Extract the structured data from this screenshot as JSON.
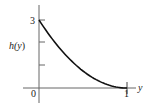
{
  "chart_data": {
    "type": "line",
    "title": "",
    "xlabel": "y",
    "ylabel": "h(y)",
    "xlim": [
      0,
      1
    ],
    "ylim": [
      0,
      3
    ],
    "grid": false,
    "legend": null,
    "x_tick_labels": [
      "0",
      "1"
    ],
    "y_tick_labels": [
      "3"
    ],
    "y_ticks": [
      1,
      2,
      3
    ],
    "series": [
      {
        "name": "h(y)",
        "x": [
          0,
          0.1,
          0.2,
          0.3,
          0.4,
          0.5,
          0.6,
          0.7,
          0.8,
          0.9,
          1.0
        ],
        "values": [
          3.0,
          2.43,
          1.92,
          1.47,
          1.08,
          0.75,
          0.48,
          0.27,
          0.12,
          0.03,
          0.0
        ]
      }
    ]
  },
  "labels": {
    "origin": "0",
    "x_one": "1",
    "y_three": "3",
    "x_axis": "y",
    "y_axis_h": "h(",
    "y_axis_var": "y",
    "y_axis_close": ")"
  },
  "colors": {
    "axis": "#555555",
    "curve": "#111111"
  }
}
